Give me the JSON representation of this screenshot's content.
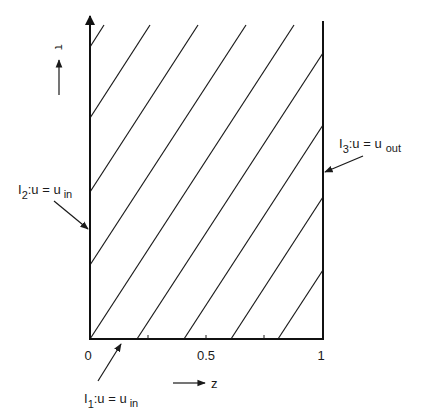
{
  "diagram": {
    "colors": {
      "ink": "#1a1a1a",
      "background": "#ffffff"
    },
    "axes": {
      "x_label": "z",
      "y_label": "τ",
      "x_ticks": [
        {
          "value": 0,
          "label": "0"
        },
        {
          "value": 0.25,
          "label": ""
        },
        {
          "value": 0.5,
          "label": "0.5"
        },
        {
          "value": 0.75,
          "label": ""
        },
        {
          "value": 1,
          "label": "1"
        }
      ]
    },
    "boundaries": [
      {
        "id": "I1",
        "label_main": "I",
        "label_index": "1",
        "label_rest": ":u = u",
        "label_sub": "in",
        "location": "bottom (τ = 0)"
      },
      {
        "id": "I2",
        "label_main": "I",
        "label_index": "2",
        "label_rest": ":u = u",
        "label_sub": "in",
        "location": "left (z = 0)"
      },
      {
        "id": "I3",
        "label_main": "I",
        "label_index": "3",
        "label_rest": ":u = u",
        "label_sub": "out",
        "location": "right (z = 1)"
      }
    ],
    "characteristics": {
      "count": 9,
      "description": "parallel straight characteristic lines with positive slope",
      "lines": [
        {
          "x1": 90,
          "y1": 47,
          "x2": 104,
          "y2": 25
        },
        {
          "x1": 90,
          "y1": 118,
          "x2": 150,
          "y2": 25
        },
        {
          "x1": 90,
          "y1": 192,
          "x2": 198,
          "y2": 25
        },
        {
          "x1": 90,
          "y1": 265,
          "x2": 246,
          "y2": 25
        },
        {
          "x1": 90,
          "y1": 339,
          "x2": 294,
          "y2": 25
        },
        {
          "x1": 137,
          "y1": 339,
          "x2": 323,
          "y2": 53
        },
        {
          "x1": 184,
          "y1": 339,
          "x2": 323,
          "y2": 125
        },
        {
          "x1": 231,
          "y1": 339,
          "x2": 323,
          "y2": 197
        },
        {
          "x1": 278,
          "y1": 339,
          "x2": 323,
          "y2": 270
        }
      ]
    }
  }
}
